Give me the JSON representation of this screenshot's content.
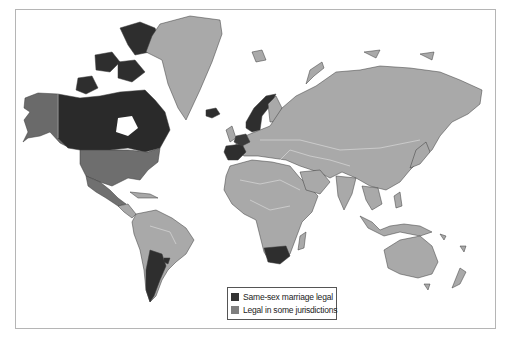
{
  "map": {
    "type": "world-choropleth",
    "colors": {
      "legal": "#333333",
      "partial": "#8a8a8a",
      "other": "#a9a9a9",
      "border": "#d8d8d8",
      "ocean": "#ffffff"
    }
  },
  "legend": {
    "items": [
      {
        "label": "Same-sex marriage legal",
        "color": "#333333"
      },
      {
        "label": "Legal in some jurisdictions",
        "color": "#7f7f7f"
      }
    ]
  }
}
